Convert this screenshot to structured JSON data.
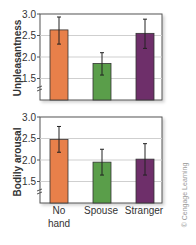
{
  "chart_data": [
    {
      "type": "bar",
      "title": "",
      "xlabel": "",
      "ylabel": "Unpleasantness",
      "categories": [
        "No hand",
        "Spouse",
        "Stranger"
      ],
      "values": [
        2.63,
        1.85,
        2.55
      ],
      "error_low": [
        2.3,
        1.58,
        2.2
      ],
      "error_high": [
        2.93,
        2.1,
        2.88
      ],
      "colors": [
        "#e8804a",
        "#5a9e4a",
        "#6e2f6a"
      ],
      "yticks": [
        "3.0",
        "2.5",
        "2.0",
        "1.5"
      ],
      "ylim": [
        1.0,
        3.0
      ],
      "axis_break": true,
      "grid": true
    },
    {
      "type": "bar",
      "title": "",
      "xlabel": "",
      "ylabel": "Bodily arousal",
      "categories": [
        "No hand",
        "Spouse",
        "Stranger"
      ],
      "values": [
        2.48,
        1.95,
        2.02
      ],
      "error_low": [
        2.18,
        1.65,
        1.65
      ],
      "error_high": [
        2.78,
        2.25,
        2.38
      ],
      "colors": [
        "#e8804a",
        "#5a9e4a",
        "#6e2f6a"
      ],
      "yticks": [
        "3.0",
        "2.5",
        "2.0",
        "1.5"
      ],
      "ylim": [
        1.0,
        3.0
      ],
      "axis_break": true,
      "grid": true
    }
  ],
  "labels": {
    "cat1_line1": "No",
    "cat1_line2": "hand",
    "cat2": "Spouse",
    "cat3": "Stranger",
    "top_ylabel": "Unpleasantness",
    "bottom_ylabel": "Bodily arousal",
    "credit": "© Cengage Learning"
  }
}
